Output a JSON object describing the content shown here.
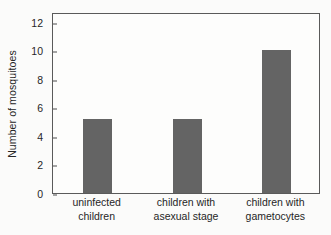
{
  "chart_data": {
    "type": "bar",
    "title": "",
    "xlabel": "",
    "ylabel": "Number of mosquitoes",
    "categories": [
      "uninfected children",
      "children with asexual stage",
      "children with gametocytes"
    ],
    "category_lines": [
      [
        "uninfected",
        "children"
      ],
      [
        "children with",
        "asexual stage"
      ],
      [
        "children with",
        "gametocytes"
      ]
    ],
    "values": [
      5.2,
      5.2,
      10.0
    ],
    "ylim": [
      0,
      12.7
    ],
    "yticks": [
      0,
      2,
      4,
      6,
      8,
      10,
      12
    ],
    "ytick_labels": [
      "0",
      "2",
      "4",
      "6",
      "8",
      "10",
      "12"
    ],
    "grid": false,
    "legend": false,
    "colors": {
      "bar": "#646464",
      "axis": "#5a5a5a",
      "text": "#262626",
      "plot_background": "#fdfdfc",
      "figure_background": "#fbfbfa"
    }
  }
}
